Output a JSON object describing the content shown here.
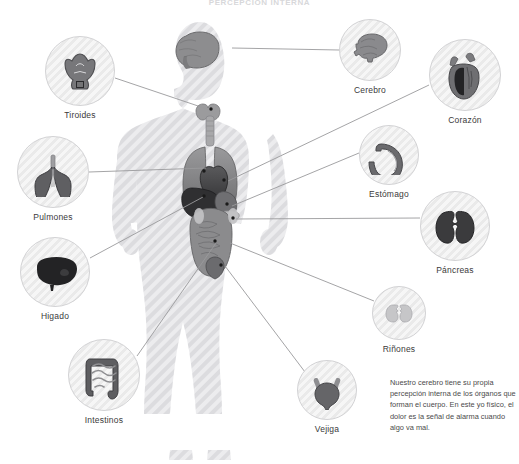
{
  "title": "PERCEPCIÓN INTERNA",
  "note": "Nuestro cerebro tiene su propia percepción interna de los órganos que forman el cuerpo. En este yo físico, el dolor es la señal de alarma cuando algo va mal.",
  "colors": {
    "background": "#ffffff",
    "body_silhouette": "#e4e4e6",
    "stripe_light": "#f6f6f6",
    "stripe_dark": "#eaeaea",
    "bubble_border": "#d2d2d4",
    "connector_line": "#9a9a9c",
    "label_text": "#3a3a3a",
    "note_text": "#4a4a4a",
    "organ_dark": "#2f2f2f",
    "organ_mid": "#7d7d7f",
    "organ_light": "#b5b5b7"
  },
  "callouts": [
    {
      "id": "tiroides",
      "label": "Tiroides",
      "icon": "thyroid-icon",
      "side": "left",
      "cx": 80,
      "cy": 71,
      "r": 35,
      "target_x": 213,
      "target_y": 111
    },
    {
      "id": "pulmones",
      "label": "Pulmones",
      "icon": "lungs-icon",
      "side": "left",
      "cx": 53,
      "cy": 172,
      "r": 36,
      "target_x": 206,
      "target_y": 168
    },
    {
      "id": "higado",
      "label": "Higado",
      "icon": "liver-icon",
      "side": "left",
      "cx": 55,
      "cy": 272,
      "r": 35,
      "target_x": 203,
      "target_y": 197
    },
    {
      "id": "intestinos",
      "label": "Intestinos",
      "icon": "intestines-icon",
      "side": "left",
      "cx": 104,
      "cy": 375,
      "r": 36,
      "target_x": 216,
      "target_y": 243
    },
    {
      "id": "cerebro",
      "label": "Cerebro",
      "icon": "brain-icon",
      "side": "right",
      "cx": 370,
      "cy": 50,
      "r": 31,
      "target_x": 226,
      "target_y": 48
    },
    {
      "id": "corazon",
      "label": "Corazón",
      "icon": "heart-icon",
      "side": "right",
      "cx": 465,
      "cy": 75,
      "r": 36,
      "target_x": 225,
      "target_y": 181
    },
    {
      "id": "estomago",
      "label": "Estómago",
      "icon": "stomach-icon",
      "side": "right",
      "cx": 389,
      "cy": 155,
      "r": 30,
      "target_x": 229,
      "target_y": 206
    },
    {
      "id": "pancreas",
      "label": "Páncreas",
      "icon": "pancreas-icon",
      "side": "right",
      "cx": 455,
      "cy": 226,
      "r": 35,
      "target_x": 233,
      "target_y": 219
    },
    {
      "id": "rinones",
      "label": "Riñones",
      "icon": "kidneys-icon",
      "side": "right",
      "cx": 399,
      "cy": 313,
      "r": 27,
      "target_x": 227,
      "target_y": 243
    },
    {
      "id": "vejiga",
      "label": "Vejiga",
      "icon": "bladder-icon",
      "side": "right",
      "cx": 327,
      "cy": 390,
      "r": 30,
      "target_x": 222,
      "target_y": 266
    }
  ],
  "body_markers": [
    {
      "id": "marker-thyroid",
      "x": 211,
      "y": 109
    },
    {
      "id": "marker-lung",
      "x": 204,
      "y": 171
    },
    {
      "id": "marker-heart",
      "x": 224,
      "y": 180
    },
    {
      "id": "marker-stomach",
      "x": 227,
      "y": 204
    },
    {
      "id": "marker-liver",
      "x": 204,
      "y": 196
    },
    {
      "id": "marker-pancreas",
      "x": 233,
      "y": 218
    },
    {
      "id": "marker-intestines",
      "x": 215,
      "y": 241
    },
    {
      "id": "marker-bladder",
      "x": 221,
      "y": 265
    }
  ]
}
